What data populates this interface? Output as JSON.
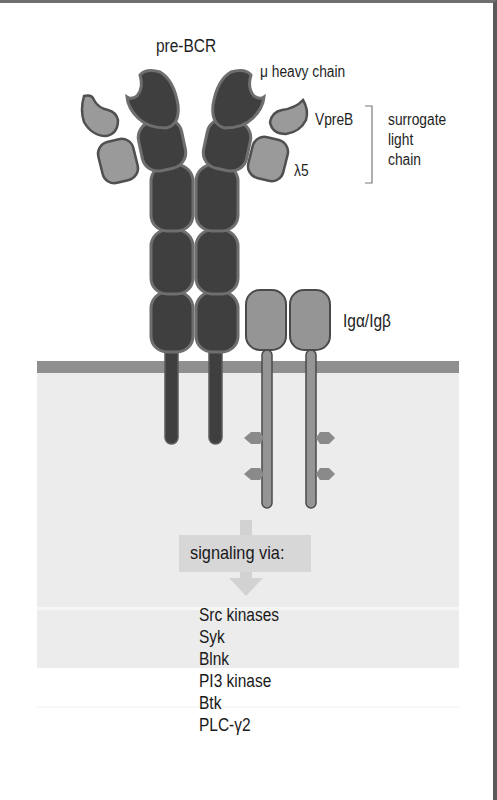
{
  "figure": {
    "title": "pre-BCR",
    "labels": {
      "heavy_chain": "μ heavy chain",
      "vpreb": "VpreB",
      "lambda5": "λ5",
      "surrogate_light_chain": [
        "surrogate",
        "light",
        "chain"
      ],
      "ig_alpha_beta": "Igα/Igβ"
    },
    "signaling": {
      "header": "signaling via:",
      "molecules": [
        "Src kinases",
        "Syk",
        "Blnk",
        "PI3 kinase",
        "Btk",
        "PLC-γ2"
      ]
    },
    "colors": {
      "heavy_chain_fill": "#3f3f3f",
      "heavy_chain_edge": "#6e6e6e",
      "light_chain_fill": "#9a9a9a",
      "light_chain_edge": "#505050",
      "ig_fill": "#959595",
      "ig_edge": "#4a4a4a",
      "membrane": "#8f8f8f",
      "cytoplasm": "#ececec",
      "signal_box": "#d7d7d7",
      "arrow": "#d2d2d2"
    }
  }
}
